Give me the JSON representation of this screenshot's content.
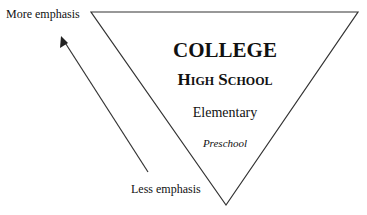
{
  "diagram": {
    "type": "inverted-pyramid",
    "levels": [
      {
        "label": "COLLEGE",
        "style": "bold-caps"
      },
      {
        "label": "High School",
        "style": "bold-small-caps"
      },
      {
        "label": "Elementary",
        "style": "regular"
      },
      {
        "label": "Preschool",
        "style": "italic"
      }
    ],
    "arrow": {
      "top_label": "More emphasis",
      "bottom_label": "Less emphasis",
      "direction": "up"
    },
    "colors": {
      "stroke": "#333333",
      "text": "#111111",
      "background": "#ffffff"
    }
  }
}
